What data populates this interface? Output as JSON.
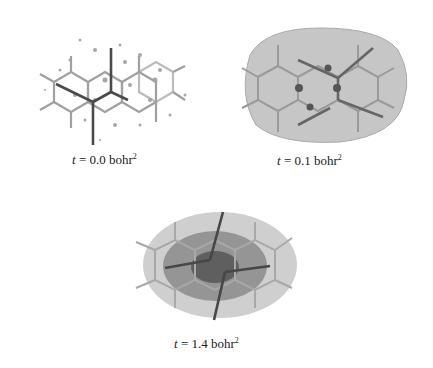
{
  "panels": [
    {
      "id": "a",
      "var": "t",
      "eq": " = 0.0 bohr",
      "exp": "2"
    },
    {
      "id": "b",
      "var": "t",
      "eq": " = 0.1 bohr",
      "exp": "2"
    },
    {
      "id": "c",
      "var": "t",
      "eq": " = 1.4 bohr",
      "exp": "2"
    }
  ],
  "colors": {
    "bond_light": "#9a9a9a",
    "bond_dark": "#555555",
    "surface_light": "#c8c8c8",
    "surface_mid": "#8f8f8f",
    "surface_dark": "#5e5e5e"
  }
}
